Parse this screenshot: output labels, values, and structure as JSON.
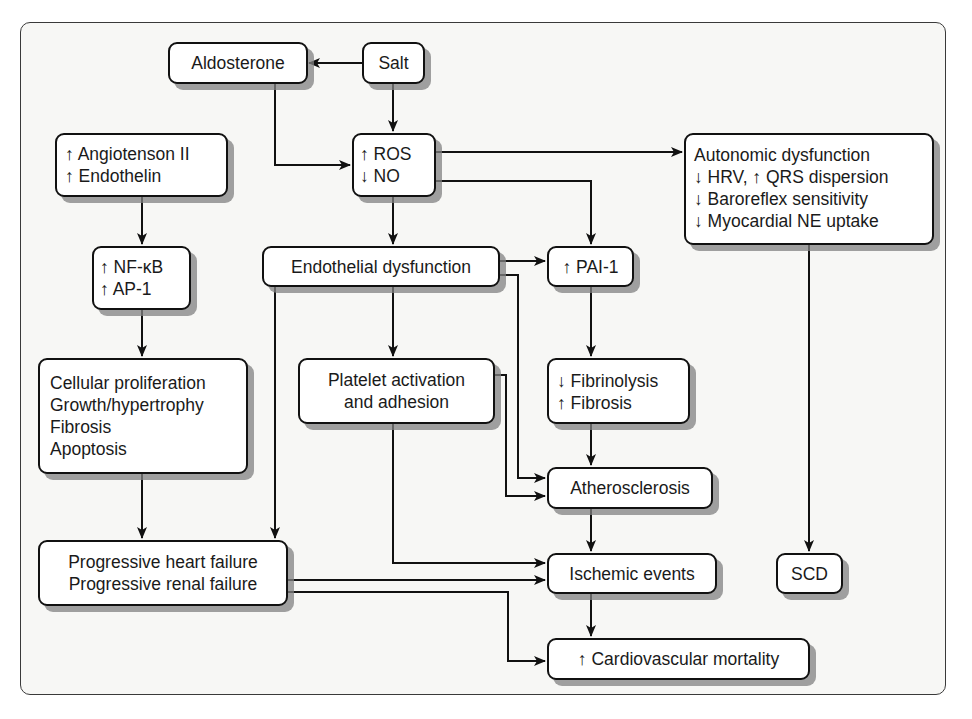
{
  "diagram": {
    "nodes": {
      "aldosterone": {
        "lines": [
          "Aldosterone"
        ]
      },
      "salt": {
        "lines": [
          "Salt"
        ]
      },
      "ros_no": {
        "lines": [
          "↑ ROS",
          "↓ NO"
        ]
      },
      "angiotensin": {
        "lines": [
          "↑ Angiotenson II",
          "↑ Endothelin"
        ]
      },
      "autonomic": {
        "lines": [
          "Autonomic dysfunction",
          "↓ HRV, ↑ QRS dispersion",
          "↓ Baroreflex sensitivity",
          "↓ Myocardial NE uptake"
        ]
      },
      "nfkb": {
        "lines": [
          "↑ NF-κB",
          "↑ AP-1"
        ]
      },
      "endothelial": {
        "lines": [
          "Endothelial dysfunction"
        ]
      },
      "pai1": {
        "lines": [
          "↑ PAI-1"
        ]
      },
      "cellular": {
        "lines": [
          "Cellular proliferation",
          "Growth/hypertrophy",
          "Fibrosis",
          "Apoptosis"
        ]
      },
      "platelet": {
        "lines": [
          "Platelet activation",
          "and adhesion"
        ]
      },
      "fibrinolysis": {
        "lines": [
          "↓ Fibrinolysis",
          "↑ Fibrosis"
        ]
      },
      "atherosclerosis": {
        "lines": [
          "Atherosclerosis"
        ]
      },
      "progressive": {
        "lines": [
          "Progressive heart failure",
          "Progressive renal failure"
        ]
      },
      "ischemic": {
        "lines": [
          "Ischemic events"
        ]
      },
      "scd": {
        "lines": [
          "SCD"
        ]
      },
      "cv_mortality": {
        "lines": [
          "↑ Cardiovascular mortality"
        ]
      }
    },
    "edges": [
      {
        "from": "salt",
        "to": "aldosterone"
      },
      {
        "from": "salt",
        "to": "ros_no"
      },
      {
        "from": "aldosterone",
        "to": "ros_no"
      },
      {
        "from": "ros_no",
        "to": "autonomic"
      },
      {
        "from": "ros_no",
        "to": "pai1"
      },
      {
        "from": "ros_no",
        "to": "endothelial"
      },
      {
        "from": "angiotensin",
        "to": "nfkb"
      },
      {
        "from": "nfkb",
        "to": "cellular"
      },
      {
        "from": "cellular",
        "to": "progressive"
      },
      {
        "from": "endothelial",
        "to": "pai1"
      },
      {
        "from": "endothelial",
        "to": "platelet"
      },
      {
        "from": "endothelial",
        "to": "progressive"
      },
      {
        "from": "endothelial",
        "to": "atherosclerosis"
      },
      {
        "from": "pai1",
        "to": "fibrinolysis"
      },
      {
        "from": "fibrinolysis",
        "to": "atherosclerosis"
      },
      {
        "from": "platelet",
        "to": "atherosclerosis"
      },
      {
        "from": "platelet",
        "to": "ischemic"
      },
      {
        "from": "atherosclerosis",
        "to": "ischemic"
      },
      {
        "from": "progressive",
        "to": "ischemic"
      },
      {
        "from": "progressive",
        "to": "cv_mortality"
      },
      {
        "from": "ischemic",
        "to": "cv_mortality"
      },
      {
        "from": "autonomic",
        "to": "scd"
      }
    ],
    "colors": {
      "line": "#111111",
      "box_fill": "#ffffff",
      "shadow": "#8a8a8a",
      "panel": "#f7f7f5"
    }
  }
}
